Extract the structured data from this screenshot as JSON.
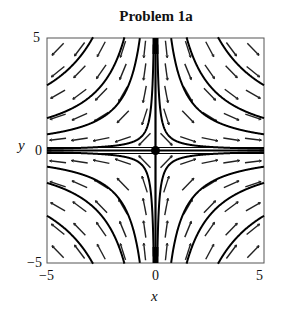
{
  "chart_data": {
    "type": "line",
    "subtype": "phase_portrait",
    "title": "Problem 1a",
    "xlabel": "x",
    "ylabel": "y",
    "xlim": [
      -5,
      5
    ],
    "ylim": [
      -5,
      5
    ],
    "xticks": [
      "-5",
      "0",
      "5"
    ],
    "yticks": [
      "-5",
      "0",
      "5"
    ],
    "grid": false,
    "legend": null,
    "system": {
      "dx": "x",
      "dy": "-y"
    },
    "equilibrium": {
      "x": 0,
      "y": 0,
      "label": "saddle"
    },
    "trajectories": {
      "family": "x*y = c",
      "c_values": [
        0.4,
        3.6,
        7.2,
        14.5,
        -0.4,
        -3.6,
        -7.2,
        -14.5
      ],
      "separatrices": [
        "x = 0",
        "y = 0"
      ]
    },
    "direction_field": {
      "nx": 10,
      "ny": 10,
      "arrow_length": 0.38
    }
  },
  "labels": {
    "title": "Problem 1a",
    "xlabel": "x",
    "ylabel": "y",
    "xtick_min": "−5",
    "xtick_zero": "0",
    "xtick_max": "5",
    "ytick_min": "−5",
    "ytick_zero": "0",
    "ytick_max": "5"
  }
}
